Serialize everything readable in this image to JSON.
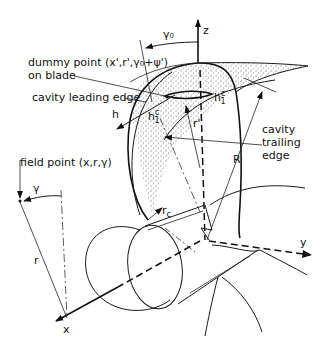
{
  "diagram": {
    "title": "",
    "axes": {
      "z": "z",
      "y": "y",
      "x": "x"
    },
    "labels": {
      "gamma0": "γ₀",
      "dummy_point_line1": "dummy point (x',r',γ₀+ψ')",
      "dummy_point_line2": "on blade",
      "cavity_leading_edge": "cavity leading edge",
      "h": "h",
      "h1c_left": "h",
      "h1c_left_sup": "c",
      "h1c_left_sub": "1",
      "h1c_right": "h",
      "h1c_right_sup": "c",
      "h1c_right_sub": "1",
      "r_prime": "r'",
      "cavity_trailing_edge_line1": "cavity",
      "cavity_trailing_edge_line2": "trailing",
      "cavity_trailing_edge_line3": "edge",
      "R": "R",
      "field_point": "field point (x,r,γ)",
      "gamma": "γ",
      "r": "r",
      "r_c": "r",
      "r_c_sub": "c"
    },
    "colors": {
      "ink": "#111111",
      "background": "#ffffff",
      "stipple": "#555555"
    }
  }
}
